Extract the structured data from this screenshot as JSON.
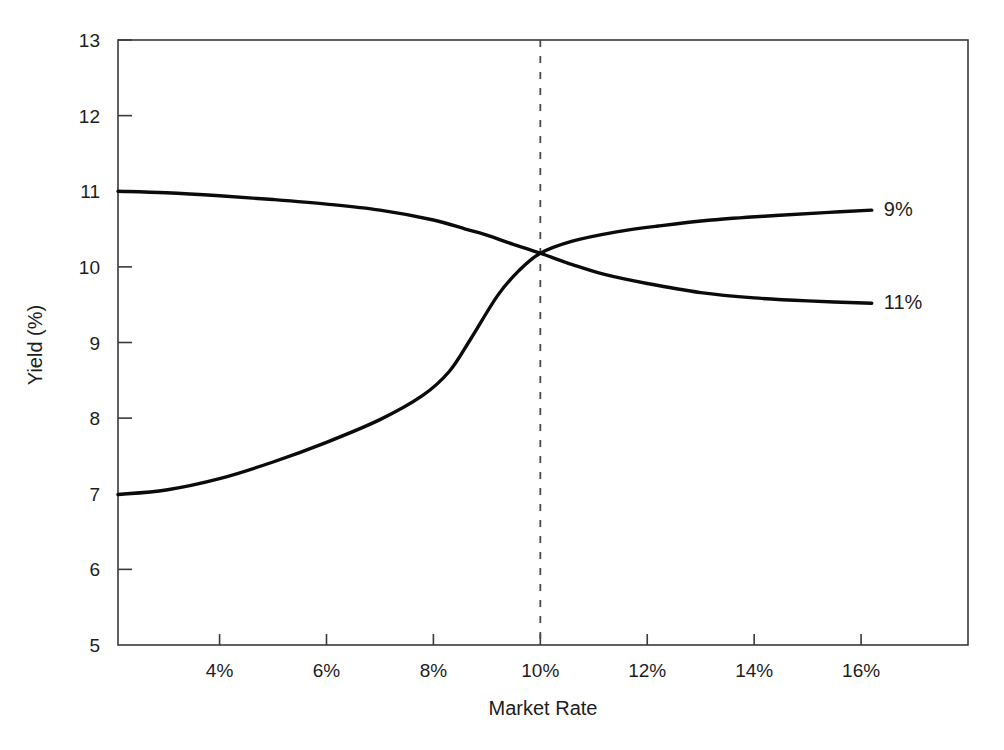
{
  "chart_data": {
    "type": "line",
    "title": "",
    "subtitle": "",
    "xlabel": "Market Rate",
    "ylabel": "Yield (%)",
    "xlim": [
      2.1,
      18.0
    ],
    "ylim": [
      5,
      13
    ],
    "xticks": [
      4,
      6,
      8,
      10,
      12,
      14,
      16
    ],
    "xtick_labels": [
      "4%",
      "6%",
      "8%",
      "10%",
      "12%",
      "14%",
      "16%"
    ],
    "yticks": [
      5,
      6,
      7,
      8,
      9,
      10,
      11,
      12,
      13
    ],
    "ytick_labels": [
      "5",
      "6",
      "7",
      "8",
      "9",
      "10",
      "11",
      "12",
      "13"
    ],
    "grid": false,
    "legend_position": "right-end-labels",
    "annotations": [
      {
        "name": "crossover-reference-line",
        "type": "vertical-dashed-line",
        "x": 10,
        "label": "10%"
      }
    ],
    "series": [
      {
        "name": "11%",
        "end_label": "11%",
        "color": "#0b0b0b",
        "x": [
          2.1,
          3.0,
          4.0,
          5.0,
          6.0,
          7.0,
          8.0,
          8.6,
          9.0,
          9.4,
          10.0,
          10.6,
          11.2,
          12.0,
          13.0,
          14.0,
          15.0,
          16.2
        ],
        "values": [
          11.0,
          10.98,
          10.94,
          10.89,
          10.83,
          10.75,
          10.62,
          10.5,
          10.42,
          10.32,
          10.18,
          10.03,
          9.9,
          9.78,
          9.66,
          9.59,
          9.55,
          9.52
        ]
      },
      {
        "name": "9%",
        "end_label": "9%",
        "color": "#0b0b0b",
        "x": [
          2.1,
          3.0,
          4.0,
          5.0,
          6.0,
          7.0,
          7.8,
          8.3,
          8.7,
          9.2,
          9.6,
          10.0,
          10.6,
          11.4,
          12.2,
          13.2,
          14.4,
          15.4,
          16.2
        ],
        "values": [
          6.99,
          7.05,
          7.2,
          7.42,
          7.68,
          7.98,
          8.3,
          8.62,
          9.05,
          9.62,
          9.95,
          10.18,
          10.34,
          10.46,
          10.54,
          10.62,
          10.68,
          10.72,
          10.75
        ]
      }
    ]
  },
  "axes": {
    "x_axis_title": "Market Rate",
    "y_axis_title": "Yield (%)"
  },
  "colors": {
    "background": "#ffffff",
    "frame": "#3a3a3a",
    "curve": "#0b0b0b",
    "reference_line": "#4a4a4a",
    "text": "#1d1d1d"
  }
}
